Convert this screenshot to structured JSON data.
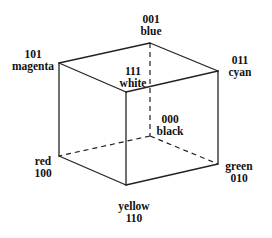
{
  "diagram": {
    "type": "rgb-color-cube",
    "line_color": "#222222",
    "vertices": {
      "magenta": {
        "code": "101",
        "name": "magenta",
        "x": 59,
        "y": 63
      },
      "blue": {
        "code": "001",
        "name": "blue",
        "x": 150,
        "y": 43
      },
      "cyan": {
        "code": "011",
        "name": "cyan",
        "x": 218,
        "y": 71
      },
      "white": {
        "code": "111",
        "name": "white",
        "x": 126,
        "y": 92
      },
      "red": {
        "code": "100",
        "name": "red",
        "x": 59,
        "y": 156
      },
      "yellow": {
        "code": "110",
        "name": "yellow",
        "x": 126,
        "y": 185
      },
      "green": {
        "code": "010",
        "name": "green",
        "x": 218,
        "y": 164
      },
      "black": {
        "code": "000",
        "name": "black",
        "x": 150,
        "y": 136
      }
    },
    "labels": {
      "blue": {
        "line1": "001",
        "line2": "blue"
      },
      "magenta": {
        "line1": "101",
        "line2": "magenta"
      },
      "cyan": {
        "line1": "011",
        "line2": "cyan"
      },
      "white": {
        "line1": "111",
        "line2": "white"
      },
      "black": {
        "line1": "000",
        "line2": "black"
      },
      "red": {
        "line1": "red",
        "line2": "100"
      },
      "green": {
        "line1": "green",
        "line2": "010"
      },
      "yellow": {
        "line1": "yellow",
        "line2": "110"
      }
    }
  }
}
